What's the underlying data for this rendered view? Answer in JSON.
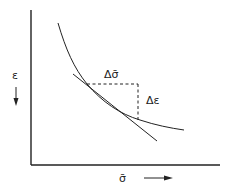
{
  "diagram": {
    "y_axis_label": "ε",
    "x_axis_label": "σ̄",
    "delta_x_label": "Δσ̄",
    "delta_y_label": "Δε",
    "colors": {
      "line": "#222222",
      "background": "#ffffff"
    }
  }
}
